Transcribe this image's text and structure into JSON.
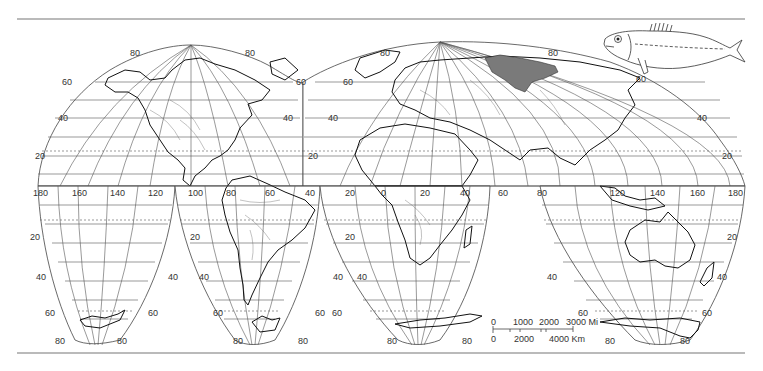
{
  "map": {
    "projection": "interrupted homolosine",
    "range_fill_color": "#7a7a7a",
    "latitude_labels": {
      "north": [
        "80",
        "60",
        "40",
        "20"
      ],
      "south": [
        "20",
        "40",
        "60",
        "80"
      ]
    },
    "longitude_labels": {
      "pacific": [
        "180",
        "160",
        "140",
        "120",
        "100"
      ],
      "americas": [
        "80",
        "60",
        "40"
      ],
      "africa_europe": [
        "20",
        "0",
        "20",
        "40",
        "60",
        "80"
      ],
      "asia": [
        "120",
        "140",
        "160",
        "180"
      ]
    },
    "lobe_labels": {
      "na_top_left": "80",
      "na_top_right": "80",
      "na_60_left": "60",
      "na_60_right": "60",
      "na_40_left": "40",
      "na_40_right": "40",
      "na_20_left": "20",
      "eu_top_left": "80",
      "eu_top_right": "80",
      "eu_60_left": "60",
      "eu_60_right": "60",
      "eu_40_left": "40",
      "eu_40_right": "40",
      "eu_20_left": "20",
      "eu_20_right": "20",
      "sa_20_left": "20",
      "sa_20_mid": "20",
      "sa_20_right": "20",
      "s1_40_left": "40",
      "s1_40_right": "40",
      "s1_60_left": "60",
      "s1_60_right": "60",
      "s1_80_left": "80",
      "s1_80_right": "80",
      "s2_40_left": "40",
      "s2_40_right": "40",
      "s2_60_left": "60",
      "s2_60_right": "60",
      "s2_80_left": "80",
      "s2_80_right": "80",
      "s3_40_right": "40",
      "s3_60_right": "60",
      "s3_80_left": "80",
      "s3_80_right": "80",
      "s4_40_left": "40",
      "s4_40_right": "40",
      "s4_60_left": "60",
      "s4_60_right": "60",
      "s4_80_left": "80",
      "s4_80_right": "80",
      "s4_20_right": "20"
    },
    "equator_labels": {
      "l180": "180",
      "l160": "160",
      "l140": "140",
      "l120": "120",
      "l100": "100",
      "l80": "80",
      "l60": "60",
      "l40": "40",
      "l20a": "20",
      "l20b": "20",
      "l0": "0",
      "l20c": "20",
      "l40b": "40",
      "l60b": "60",
      "l80b": "80",
      "l120b": "120",
      "l140b": "140",
      "l160b": "160",
      "l180b": "180"
    }
  },
  "scale_bar": {
    "miles_labels": [
      "0",
      "1000",
      "2000",
      "3000 Mi"
    ],
    "km_labels": [
      "0",
      "2000",
      "4000 Km"
    ]
  },
  "illustration": {
    "subject": "fish"
  }
}
